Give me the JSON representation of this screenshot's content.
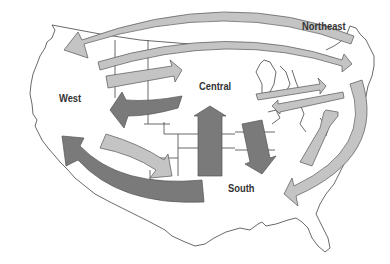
{
  "diagram": {
    "type": "migration-flow-map",
    "regions": [
      {
        "id": "west",
        "label": "West"
      },
      {
        "id": "central",
        "label": "Central"
      },
      {
        "id": "northeast",
        "label": "Northeast"
      },
      {
        "id": "south",
        "label": "South"
      }
    ],
    "colors": {
      "light_arrow": "#c4c4c4",
      "dark_arrow": "#7a7a7a",
      "arrow_stroke": "#555555",
      "map_outline": "#444444",
      "background": "#ffffff"
    },
    "arrows": [
      {
        "from": "northeast",
        "to": "west",
        "shade": "light",
        "shape": "long arc across top"
      },
      {
        "from": "west",
        "to": "northeast",
        "shade": "light",
        "shape": "long arc across top"
      },
      {
        "from": "west",
        "to": "central",
        "shade": "light"
      },
      {
        "from": "central",
        "to": "west",
        "shade": "dark"
      },
      {
        "from": "west",
        "to": "south",
        "shade": "light"
      },
      {
        "from": "south",
        "to": "west",
        "shade": "dark",
        "shape": "large arc"
      },
      {
        "from": "south",
        "to": "central",
        "shade": "dark"
      },
      {
        "from": "central",
        "to": "south",
        "shade": "dark"
      },
      {
        "from": "central",
        "to": "northeast",
        "shade": "light"
      },
      {
        "from": "northeast",
        "to": "central",
        "shade": "light"
      },
      {
        "from": "south",
        "to": "northeast",
        "shade": "light"
      },
      {
        "from": "northeast",
        "to": "south",
        "shade": "light",
        "shape": "arc down east coast"
      }
    ]
  }
}
